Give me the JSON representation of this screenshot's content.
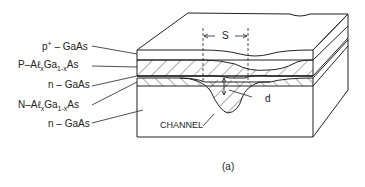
{
  "figure": {
    "caption": "(a)",
    "labels": {
      "p_gaas": {
        "prefix": "p",
        "sup": "+",
        "suffix": " – GaAs"
      },
      "p_algaas": {
        "prefix": "P–Aℓ",
        "sub1": "x",
        "mid": "Ga",
        "sub2": "1-x",
        "suffix": "As"
      },
      "n_gaas_1": {
        "text": "n – GaAs"
      },
      "n_algaas": {
        "prefix": "N–Aℓ",
        "sub1": "x",
        "mid": "Ga",
        "sub2": "1-x",
        "suffix": "As"
      },
      "n_gaas_2": {
        "text": "n – GaAs"
      }
    },
    "dimension_s": "S",
    "dimension_d": "d",
    "channel_label": "CHANNEL"
  }
}
